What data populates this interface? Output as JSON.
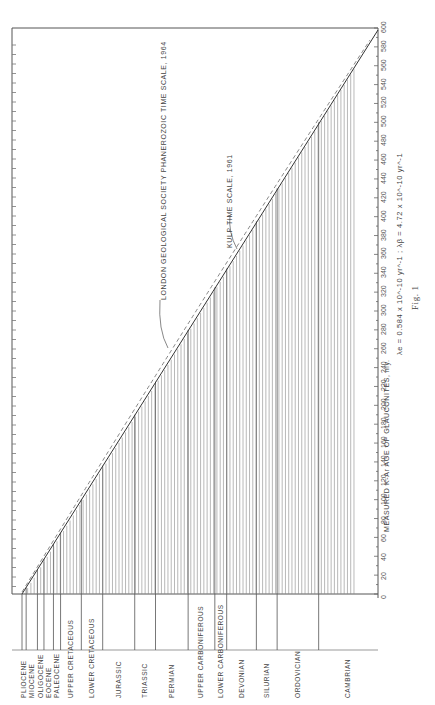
{
  "figure_caption": "Fig. 1",
  "chart_data": {
    "type": "line",
    "orientation": "rotated 90° counter-clockwise (x axis runs along right edge, bottom=0, top=600)",
    "title": "",
    "xlabel": "MEASURED K-Ar AGE OF GLAUCONITES, my.",
    "decay_constants": "λe = 0.584 x 10^-10 yr^-1 ; λβ = 4.72 x 10^-10 yr^-1",
    "xlim": [
      0,
      600
    ],
    "x_ticks": [
      0,
      20,
      40,
      60,
      80,
      100,
      120,
      140,
      160,
      180,
      200,
      220,
      240,
      260,
      280,
      300,
      320,
      340,
      360,
      380,
      400,
      420,
      440,
      460,
      480,
      500,
      520,
      540,
      560,
      580,
      600
    ],
    "series": [
      {
        "name": "LONDON GEOLOGICAL SOCIETY PHANEROZOIC TIME SCALE, 1964",
        "style": "solid"
      },
      {
        "name": "KULP TIME SCALE, 1961",
        "style": "dashed"
      }
    ],
    "periods": [
      {
        "label": "PLIOCENE",
        "top_my": 0
      },
      {
        "label": "MIOCENE",
        "top_my": 7
      },
      {
        "label": "OLIGOCENE",
        "top_my": 26
      },
      {
        "label": "EOCENE",
        "top_my": 37
      },
      {
        "label": "PALEOCENE",
        "top_my": 53
      },
      {
        "label": "UPPER CRETACEOUS",
        "top_my": 65
      },
      {
        "label": "LOWER CRETACEOUS",
        "top_my": 100
      },
      {
        "label": "JURASSIC",
        "top_my": 136
      },
      {
        "label": "TRIASSIC",
        "top_my": 190
      },
      {
        "label": "PERMIAN",
        "top_my": 225
      },
      {
        "label": "UPPER CARBONIFEROUS",
        "top_my": 280
      },
      {
        "label": "LOWER CARBONIFEROUS",
        "top_my": 325
      },
      {
        "label": "DEVONIAN",
        "top_my": 345
      },
      {
        "label": "SILURIAN",
        "top_my": 395
      },
      {
        "label": "ORDOVICIAN",
        "top_my": 430
      },
      {
        "label": "CAMBRIAN",
        "top_my": 500
      }
    ],
    "annotations": [
      "LONDON GEOLOGICAL SOCIETY PHANEROZOIC TIME SCALE, 1964",
      "KULP TIME SCALE, 1961"
    ],
    "grid": false
  }
}
